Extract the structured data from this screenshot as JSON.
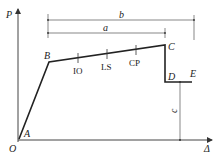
{
  "diagram": {
    "axes": {
      "y_label": "P",
      "x_label": "Δ",
      "origin_label": "O"
    },
    "points": {
      "A": "A",
      "B": "B",
      "C": "C",
      "D": "D",
      "E": "E"
    },
    "performance_levels": [
      "IO",
      "LS",
      "CP"
    ],
    "dimensions": {
      "a": "a",
      "b": "b",
      "c": "c"
    }
  }
}
